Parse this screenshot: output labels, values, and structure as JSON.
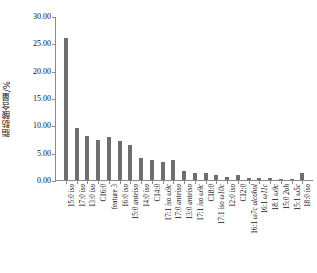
{
  "chart_data": {
    "type": "bar",
    "title": "",
    "xlabel": "",
    "ylabel": "脂肪酸含量/%",
    "ylim": [
      0,
      30
    ],
    "ytick_labels": [
      "0.00",
      "5.00",
      "10.00",
      "15.00",
      "20.00",
      "25.00",
      "30.00"
    ],
    "ytick_values": [
      0,
      5,
      10,
      15,
      20,
      25,
      30
    ],
    "grid": false,
    "legend": "none",
    "bar_color": "#6f6f6f",
    "axis_color": "#8a8a8a",
    "categories": [
      "15:0 iso",
      "17:0 iso",
      "13:0 iso",
      "C16:0",
      "feature 3",
      "16:0 iso",
      "15:0 anteiso",
      "14:0 iso",
      "C14:0",
      "17:1 iso ω9c",
      "17:0 anteiso",
      "13:0 anteiso",
      "17:1 iso ω9c",
      "C18:0",
      "17:1 iso ω10c",
      "12:0 iso",
      "C12:0",
      "16:1 ω7c alcohol",
      "16:1 ω11c",
      "18:1 ω9c",
      "15:0 2oh",
      "15:1 ω5c",
      "18:0 iso"
    ],
    "values": [
      26.2,
      9.5,
      8.1,
      7.3,
      8.0,
      7.1,
      6.4,
      4.0,
      3.7,
      3.3,
      3.6,
      1.6,
      1.2,
      1.3,
      1.0,
      0.55,
      0.85,
      0.35,
      0.3,
      0.28,
      0.22,
      0.2,
      1.2
    ]
  }
}
